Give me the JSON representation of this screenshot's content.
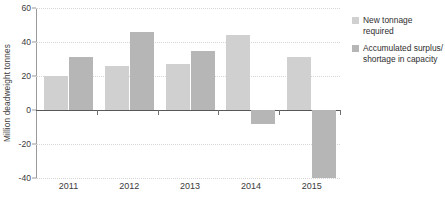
{
  "chart_data": {
    "type": "bar",
    "title": "",
    "xlabel": "",
    "ylabel": "Million deadweight tonnes",
    "categories": [
      "2011",
      "2012",
      "2013",
      "2014",
      "2015"
    ],
    "series": [
      {
        "name": "New tonnage required",
        "color": "#d0d0d0",
        "values": [
          20,
          26,
          27,
          44,
          31
        ]
      },
      {
        "name": "Accumulated surplus/\nshortage in capacity",
        "color": "#b6b6b6",
        "values": [
          31,
          46,
          35,
          -8,
          -40
        ]
      }
    ],
    "ylim": [
      -40,
      60
    ],
    "yticks": [
      60,
      40,
      20,
      0,
      -20,
      -40
    ],
    "ytick_labels": [
      "60",
      "40",
      "20",
      "0",
      "-20",
      "-40"
    ],
    "grid": true,
    "legend_position": "right",
    "zero_line": 0
  }
}
